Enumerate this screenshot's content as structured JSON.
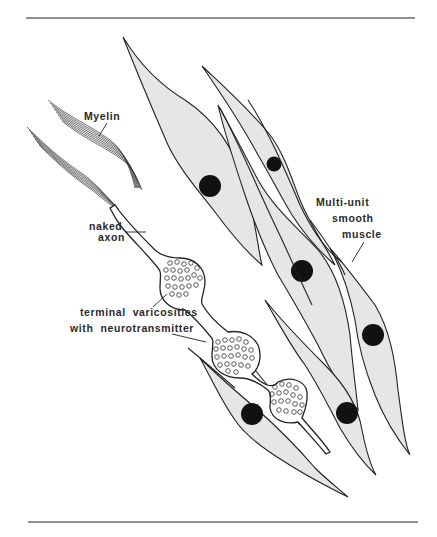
{
  "figure": {
    "labels": {
      "myelin": "Myelin",
      "naked_axon_line1": "naked",
      "naked_axon_line2": "axon",
      "varicosities_line1": "terminal  varicosities",
      "varicosities_line2": "with  neurotransmitter",
      "muscle_line1": "Multi-unit",
      "muscle_line2": "smooth",
      "muscle_line3": "muscle"
    },
    "components": {
      "smooth_muscle_cells": 7,
      "varicosities": 3,
      "myelin_sheath_fragments": 2
    },
    "colors": {
      "cell_fill": "#e6e6e6",
      "nucleus": "#111111",
      "outline": "#222222",
      "rule": "#6a6a6a"
    }
  }
}
